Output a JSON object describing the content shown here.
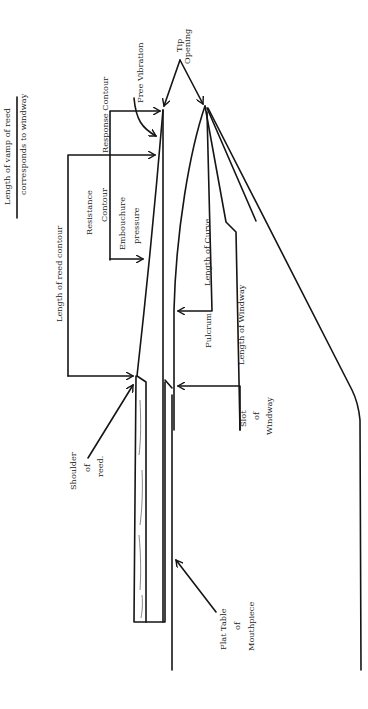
{
  "diagram": {
    "labels": {
      "vamp_line1": "Length of vamp of reed",
      "vamp_line2": "corresponds to windway",
      "reed_contour": "Length of reed contour",
      "resistance1": "Resistance",
      "resistance2": "Contour",
      "embouchure1": "Embouchure",
      "embouchure2": "pressure",
      "response": "Response Contour",
      "free_vibration": "Free Vibration",
      "tip1": "Tip",
      "tip2": "Opening",
      "length_curve": "Length of Curve",
      "fulcrum": "Fulcrum",
      "length_windway": "Length of Windway",
      "slot1": "Slot",
      "slot2": "of",
      "slot3": "Windway",
      "shoulder1": "Shoulder",
      "shoulder2": "of",
      "shoulder3": "reed.",
      "table1": "Flat Table",
      "table2": "of",
      "table3": "Mouthpiece"
    }
  }
}
